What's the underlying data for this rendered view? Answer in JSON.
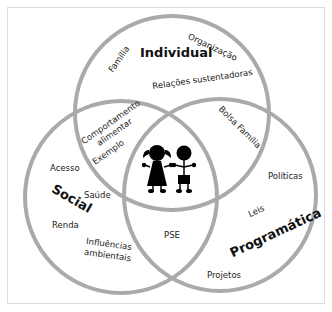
{
  "diagram": {
    "type": "venn",
    "circle_color": "#aaaaaa",
    "sets": [
      {
        "id": "individual",
        "label": "Individual"
      },
      {
        "id": "social",
        "label": "Social"
      },
      {
        "id": "programatica",
        "label": "Programática"
      }
    ],
    "labels": {
      "individual_only": [
        "Família",
        "Organização",
        "Relações sustentadoras"
      ],
      "individual_social": [
        "Comportamento",
        "alimentar",
        "Exemplo"
      ],
      "individual_programatica": [
        "Bolsa Família"
      ],
      "social_only": [
        "Acesso",
        "Saúde",
        "Renda",
        "Influências",
        "ambientais"
      ],
      "social_programatica": [
        "PSE"
      ],
      "programatica_only": [
        "Políticas",
        "Leis",
        "Projetos"
      ],
      "center": "children-icon"
    }
  }
}
